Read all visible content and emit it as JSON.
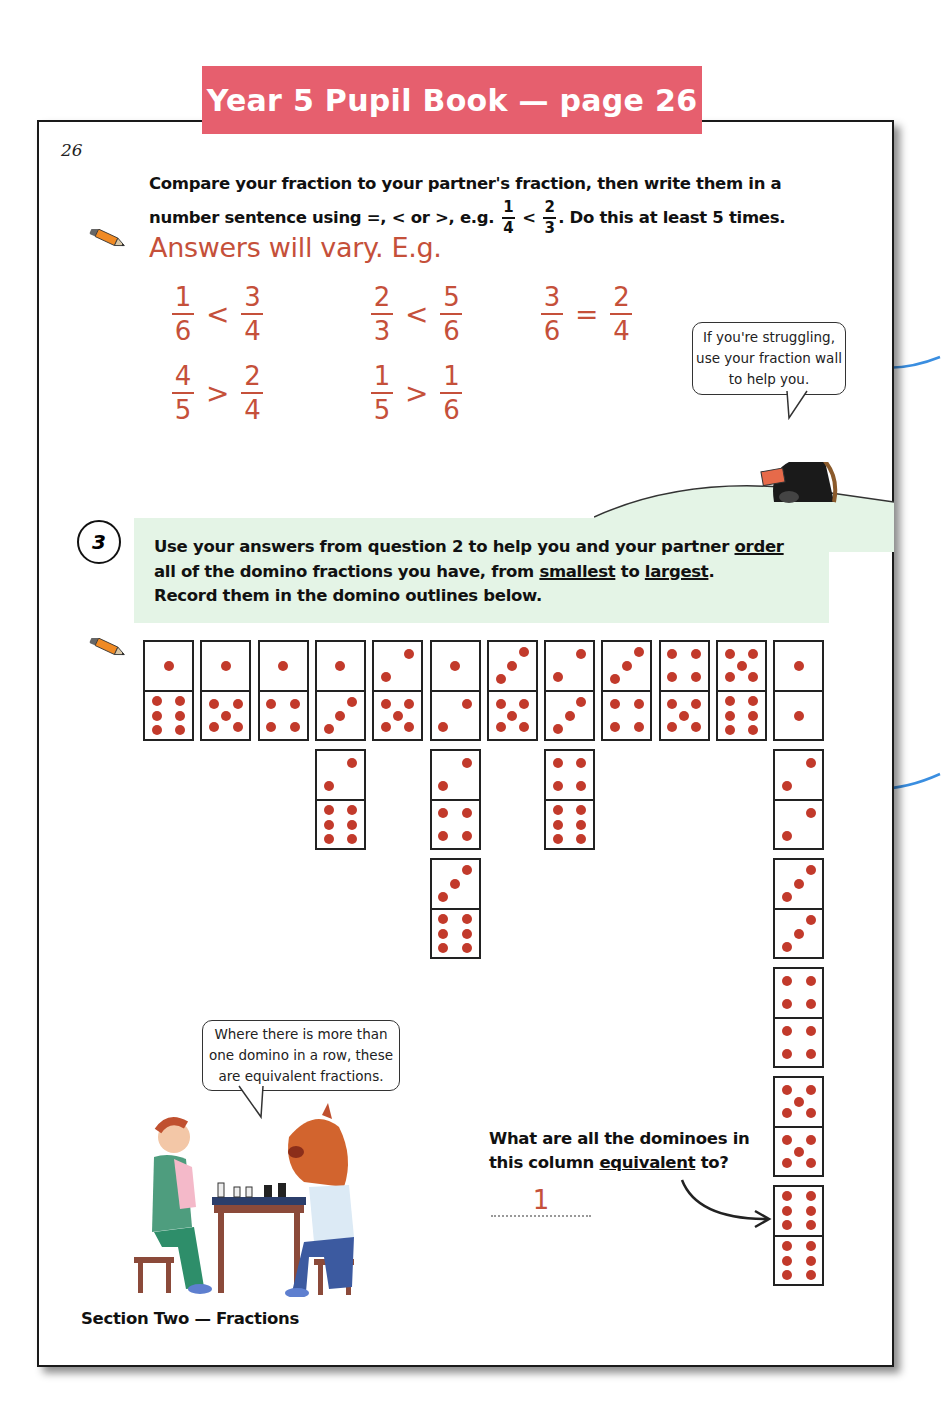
{
  "banner": {
    "title": "Year 5 Pupil Book — page 26",
    "color": "#E65F6E"
  },
  "page": {
    "page_number": "26",
    "footer": "Section Two — Fractions"
  },
  "question2": {
    "instruction_line1": "Compare your fraction to your partner's fraction, then write them in a",
    "instruction_line2_pre": "number sentence using =, < or >,  e.g.",
    "example": {
      "left": {
        "num": "1",
        "den": "4"
      },
      "op": "<",
      "right": {
        "num": "2",
        "den": "3"
      }
    },
    "instruction_line2_post": ".  Do this at least 5 times.",
    "answers_heading": "Answers will vary.  E.g.",
    "answer_color": "#C5503A",
    "answers": [
      {
        "left": {
          "num": "1",
          "den": "6"
        },
        "op": "<",
        "right": {
          "num": "3",
          "den": "4"
        }
      },
      {
        "left": {
          "num": "2",
          "den": "3"
        },
        "op": "<",
        "right": {
          "num": "5",
          "den": "6"
        }
      },
      {
        "left": {
          "num": "3",
          "den": "6"
        },
        "op": "=",
        "right": {
          "num": "2",
          "den": "4"
        }
      },
      {
        "left": {
          "num": "4",
          "den": "5"
        },
        "op": ">",
        "right": {
          "num": "2",
          "den": "4"
        }
      },
      {
        "left": {
          "num": "1",
          "den": "5"
        },
        "op": ">",
        "right": {
          "num": "1",
          "den": "6"
        }
      }
    ],
    "tip_bubble": "If you're struggling, use your fraction wall to help you."
  },
  "question3": {
    "number": "3",
    "line1_pre": "Use your answers from question 2 to help you and your partner ",
    "line1_underline": "order",
    "line2_pre": "all of the domino fractions you have, from ",
    "line2_u1": "smallest",
    "line2_mid": " to ",
    "line2_u2": "largest",
    "line2_post": ".",
    "line3": "Record them in the domino outlines below.",
    "band_color": "#E4F4E6"
  },
  "dominoes": {
    "columns": [
      {
        "label": "1/6",
        "stack": [
          [
            1,
            6
          ]
        ]
      },
      {
        "label": "1/5",
        "stack": [
          [
            1,
            5
          ]
        ]
      },
      {
        "label": "1/4",
        "stack": [
          [
            1,
            4
          ]
        ]
      },
      {
        "label": "1/3",
        "stack": [
          [
            1,
            3
          ],
          [
            2,
            6
          ]
        ]
      },
      {
        "label": "2/5",
        "stack": [
          [
            2,
            5
          ]
        ]
      },
      {
        "label": "1/2",
        "stack": [
          [
            1,
            2
          ],
          [
            2,
            4
          ],
          [
            3,
            6
          ]
        ]
      },
      {
        "label": "3/5",
        "stack": [
          [
            3,
            5
          ]
        ]
      },
      {
        "label": "2/3",
        "stack": [
          [
            2,
            3
          ],
          [
            4,
            6
          ]
        ]
      },
      {
        "label": "3/4",
        "stack": [
          [
            3,
            4
          ]
        ]
      },
      {
        "label": "4/5",
        "stack": [
          [
            4,
            5
          ]
        ]
      },
      {
        "label": "5/6",
        "stack": [
          [
            5,
            6
          ]
        ]
      },
      {
        "label": "1",
        "stack": [
          [
            1,
            1
          ],
          [
            2,
            2
          ],
          [
            3,
            3
          ],
          [
            4,
            4
          ],
          [
            5,
            5
          ],
          [
            6,
            6
          ]
        ]
      }
    ],
    "pip_color": "#C23A2B"
  },
  "equivalent_question": {
    "line1": "What are all the dominoes in",
    "line2_pre": "this column ",
    "line2_underline": "equivalent",
    "line2_post": " to?",
    "answer": "1"
  },
  "chess_bubble": "Where there is more than one domino in a row, these are equivalent fractions.",
  "icons": {
    "pencil": "pencil-icon",
    "horse_cards": "horse-with-cards-illustration",
    "chess_players": "chess-players-illustration",
    "arrow": "curved-arrow-icon"
  }
}
